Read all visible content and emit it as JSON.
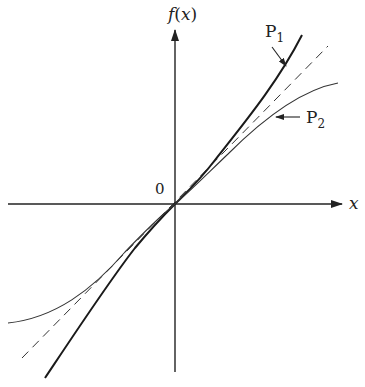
{
  "figure": {
    "y_axis_label": "f(x)",
    "y_axis_label_f": "f",
    "y_axis_label_open": "(",
    "y_axis_label_x": "x",
    "y_axis_label_close": ")",
    "x_axis_label": "x",
    "origin_label": "0",
    "curve_labels": [
      {
        "id": "P1",
        "main": "P",
        "sub": "1"
      },
      {
        "id": "P2",
        "main": "P",
        "sub": "2"
      }
    ],
    "series": [
      {
        "name": "P1",
        "style": "thick solid",
        "description": "curve steeper than tangent line (bends away above line for x>0, below for x<0)"
      },
      {
        "name": "tangent",
        "style": "dashed",
        "description": "straight line through origin"
      },
      {
        "name": "P2",
        "style": "thin solid",
        "description": "curve flatter than tangent line (bends below line for x>0, above for x<0)"
      }
    ],
    "colors": {
      "ink": "#222222",
      "background": "#ffffff"
    }
  }
}
